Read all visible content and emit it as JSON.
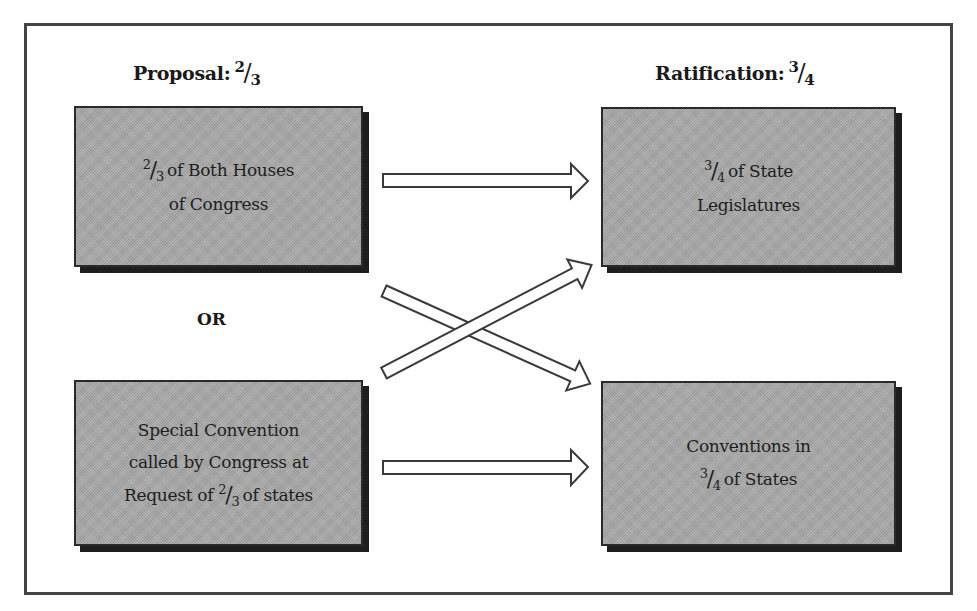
{
  "diagram": {
    "type": "flow",
    "colors": {
      "frame_border": "#444444",
      "box_fill": "#a9a9a9",
      "box_border": "#2a2a2a",
      "box_shadow": "#1e1e1e",
      "arrow_fill": "#ffffff",
      "arrow_stroke": "#3a3a3a"
    },
    "columns": {
      "proposal": {
        "heading": "Proposal:",
        "fraction": {
          "num": "2",
          "den": "3"
        }
      },
      "ratification": {
        "heading": "Ratification:",
        "fraction": {
          "num": "3",
          "den": "4"
        }
      }
    },
    "separator": "OR",
    "boxes": {
      "congress": {
        "line1_frac": {
          "num": "2",
          "den": "3"
        },
        "line1_text": "of Both Houses",
        "line2": "of Congress"
      },
      "convention": {
        "line1": "Special Convention",
        "line2": "called by Congress at",
        "line3_pre": "Request of",
        "line3_frac": {
          "num": "2",
          "den": "3"
        },
        "line3_post": "of states"
      },
      "legislatures": {
        "line1_frac": {
          "num": "3",
          "den": "4"
        },
        "line1_text": "of State",
        "line2": "Legislatures"
      },
      "state_conventions": {
        "line1": "Conventions in",
        "line2_frac": {
          "num": "3",
          "den": "4"
        },
        "line2_text": "of States"
      }
    },
    "arrows": [
      {
        "from": "congress",
        "to": "legislatures"
      },
      {
        "from": "congress",
        "to": "state_conventions"
      },
      {
        "from": "convention",
        "to": "legislatures"
      },
      {
        "from": "convention",
        "to": "state_conventions"
      }
    ]
  }
}
